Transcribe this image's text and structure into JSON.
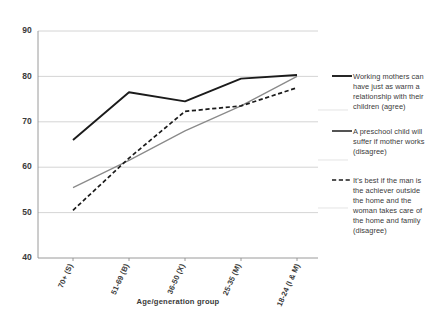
{
  "chart_data": {
    "type": "line",
    "title": "",
    "xlabel": "Age/generation group",
    "ylabel": "",
    "categories": [
      "70+ (S)",
      "51-69 (B)",
      "36-50 (X)",
      "25-35 (M)",
      "18-24 (I & M)"
    ],
    "ylim": [
      40,
      90
    ],
    "yticks": [
      40,
      50,
      60,
      70,
      80,
      90
    ],
    "grid": true,
    "legend_position": "right",
    "series": [
      {
        "name": "Working mothers can have just as warm a relationship with their children (agree)",
        "style": "solid-black",
        "color": "#1b1b1b",
        "values": [
          66,
          76.5,
          74.5,
          79.5,
          80.3
        ]
      },
      {
        "name": "A preschool child will suffer if mother works (disagree)",
        "style": "solid-gray",
        "color": "#8a8a8a",
        "values": [
          55.5,
          61.5,
          68,
          73.5,
          80
        ]
      },
      {
        "name": "It's best if the man is the achiever outside the home and the woman takes care of the home and family (disagree)",
        "style": "dashed-black",
        "color": "#1b1b1b",
        "values": [
          50.5,
          62,
          72.3,
          73.5,
          77.5
        ]
      }
    ]
  },
  "axis": {
    "y_labels": [
      "90",
      "80",
      "70",
      "60",
      "50",
      "40"
    ],
    "x_labels": [
      "70+ (S)",
      "51-69 (B)",
      "36-50 (X)",
      "25-35 (M)",
      "18-24 (I & M)"
    ],
    "x_title": "Age/generation group"
  },
  "legend": {
    "entries": [
      {
        "swatch": "solid-line-swatch",
        "lines": [
          "Working mothers can",
          "have just as warm a",
          "relationship with their",
          "children (agree)"
        ]
      },
      {
        "swatch": "solid-line-swatch",
        "lines": [
          "A preschool child will",
          "suffer if mother works",
          "(disagree)"
        ]
      },
      {
        "swatch": "dashed-line-swatch",
        "lines": [
          "It's best if the man is",
          "the achiever outside",
          "the home and the",
          "woman takes care of",
          "the home and family",
          "(disagree)"
        ]
      }
    ]
  }
}
